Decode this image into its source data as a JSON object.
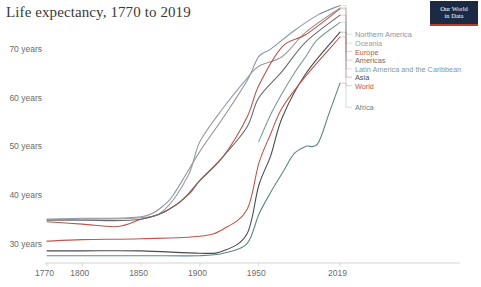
{
  "header": {
    "title": "Life expectancy, 1770 to 2019",
    "logo": {
      "line1": "Our World",
      "line2": "in Data",
      "bg_color": "#1d2a43",
      "accent_color": "#c0392b"
    }
  },
  "chart_data": {
    "type": "line",
    "title": "Life expectancy, 1770 to 2019",
    "xlabel": "",
    "ylabel": "",
    "xlim": [
      1770,
      2019
    ],
    "ylim": [
      26,
      76
    ],
    "grid": false,
    "legend_position": "right",
    "x_ticks": [
      "1770",
      "1800",
      "1850",
      "1900",
      "1950",
      "2019"
    ],
    "x_tick_values": [
      1770,
      1800,
      1850,
      1900,
      1950,
      2019
    ],
    "y_ticks": [
      "30 years",
      "40 years",
      "50 years",
      "60 years",
      "70 years"
    ],
    "y_tick_values": [
      30,
      40,
      50,
      60,
      70
    ],
    "series": [
      {
        "name": "Northern America",
        "color": "#8a93a8",
        "x": [
          1770,
          1800,
          1850,
          1870,
          1880,
          1900,
          1920,
          1940,
          1950,
          1960,
          1980,
          2000,
          2019
        ],
        "values": [
          35.0,
          35.2,
          35.5,
          38.0,
          41.0,
          49.0,
          56.0,
          63.5,
          68.5,
          70.0,
          73.8,
          77.0,
          79.0
        ]
      },
      {
        "name": "Oceania",
        "color": "#9b9b9b",
        "x": [
          1770,
          1800,
          1850,
          1870,
          1890,
          1900,
          1920,
          1940,
          1950,
          1970,
          1990,
          2019
        ],
        "values": [
          35.0,
          35.0,
          35.3,
          37.0,
          44.0,
          51.0,
          58.0,
          64.0,
          66.5,
          68.5,
          73.5,
          78.5
        ]
      },
      {
        "name": "Europe",
        "color": "#b5574e",
        "x": [
          1770,
          1800,
          1830,
          1850,
          1870,
          1890,
          1900,
          1920,
          1940,
          1950,
          1970,
          1990,
          2019
        ],
        "values": [
          34.5,
          34.0,
          33.5,
          35.0,
          36.5,
          40.0,
          43.0,
          48.0,
          56.0,
          62.5,
          70.5,
          73.0,
          78.3
        ]
      },
      {
        "name": "Americas",
        "color": "#6b6b6b",
        "x": [
          1770,
          1800,
          1850,
          1880,
          1900,
          1920,
          1940,
          1950,
          1970,
          1990,
          2019
        ],
        "values": [
          34.8,
          34.8,
          35.0,
          38.0,
          43.0,
          48.0,
          54.0,
          60.0,
          65.5,
          71.5,
          77.0
        ]
      },
      {
        "name": "Latin America and the Caribbean",
        "color": "#7f9a94",
        "x": [
          1950,
          1960,
          1970,
          1980,
          1990,
          2000,
          2019
        ],
        "values": [
          51.0,
          56.5,
          61.0,
          65.0,
          68.5,
          72.0,
          75.5
        ]
      },
      {
        "name": "Asia",
        "color": "#4a4a52",
        "x": [
          1770,
          1800,
          1850,
          1900,
          1920,
          1940,
          1950,
          1960,
          1970,
          1990,
          2019
        ],
        "values": [
          28.5,
          28.5,
          28.5,
          28.0,
          28.5,
          32.0,
          42.0,
          48.0,
          56.0,
          65.0,
          73.5
        ]
      },
      {
        "name": "World",
        "color": "#c0564c",
        "x": [
          1770,
          1800,
          1850,
          1900,
          1920,
          1940,
          1950,
          1960,
          1970,
          1990,
          2019
        ],
        "values": [
          30.5,
          30.8,
          31.0,
          31.5,
          33.0,
          37.0,
          46.5,
          52.5,
          58.0,
          64.5,
          72.5
        ]
      },
      {
        "name": "Africa",
        "color": "#5d8a80",
        "x": [
          1770,
          1850,
          1900,
          1920,
          1940,
          1950,
          1960,
          1970,
          1980,
          1990,
          2000,
          2010,
          2019
        ],
        "values": [
          27.5,
          27.5,
          27.5,
          28.0,
          30.0,
          36.0,
          40.5,
          44.5,
          48.5,
          50.0,
          50.5,
          57.0,
          63.0
        ]
      }
    ]
  },
  "legend": {
    "items": [
      {
        "label": "Northern America",
        "color": "#8a93a8"
      },
      {
        "label": "Oceania",
        "color": "#9b9b9b"
      },
      {
        "label": "Europe",
        "color": "#b5574e"
      },
      {
        "label": "Americas",
        "color": "#6b6b6b"
      },
      {
        "label": "Latin America and the Caribbean",
        "color": "#7f9a94"
      },
      {
        "label": "Asia",
        "color": "#4a4a52"
      },
      {
        "label": "World",
        "color": "#c0564c"
      },
      {
        "label": "Africa",
        "color": "#5d8a80"
      }
    ]
  },
  "axis": {
    "line_color": "#cfcfcf",
    "tick_color": "#6b6b6b"
  }
}
